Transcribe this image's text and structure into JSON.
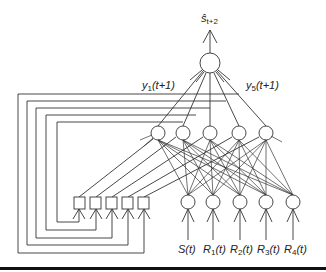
{
  "diagram": {
    "output": {
      "label_main": "ŝ",
      "label_sub": "t+2"
    },
    "hidden_labels": {
      "first": {
        "main": "y",
        "sub": "1",
        "tail": "(t+1)"
      },
      "last": {
        "main": "y",
        "sub": "5",
        "tail": "(t+1)"
      }
    },
    "inputs": [
      {
        "main": "S",
        "sub": "",
        "tail": "(t)"
      },
      {
        "main": "R",
        "sub": "1",
        "tail": "(t)"
      },
      {
        "main": "R",
        "sub": "2",
        "tail": "(t)"
      },
      {
        "main": "R",
        "sub": "3",
        "tail": "(t)"
      },
      {
        "main": "R",
        "sub": "4",
        "tail": "(t)"
      }
    ],
    "counts": {
      "hidden_nodes": 5,
      "context_units": 5,
      "input_nodes": 5,
      "output_nodes": 1
    },
    "colors": {
      "line": "#333333",
      "background": "#ffffff",
      "rule": "#111111"
    }
  }
}
